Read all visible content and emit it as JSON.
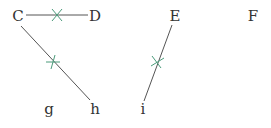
{
  "diagram": {
    "points": {
      "C": {
        "label": "C",
        "x": 18,
        "y": 21
      },
      "D": {
        "label": "D",
        "x": 95,
        "y": 21
      },
      "E": {
        "label": "E",
        "x": 175,
        "y": 21
      },
      "F": {
        "label": "F",
        "x": 253,
        "y": 21
      },
      "g": {
        "label": "g",
        "x": 49,
        "y": 116
      },
      "h": {
        "label": "h",
        "x": 95,
        "y": 116
      },
      "i": {
        "label": "i",
        "x": 143,
        "y": 116
      }
    },
    "segments": [
      {
        "from": "C",
        "to": "D",
        "marked": true
      },
      {
        "from": "C",
        "to": "h",
        "marked": true
      },
      {
        "from": "E",
        "to": "i",
        "marked": true
      }
    ],
    "colors": {
      "line": "#555555",
      "mark": "#4a9a7a",
      "text": "#333333"
    }
  }
}
